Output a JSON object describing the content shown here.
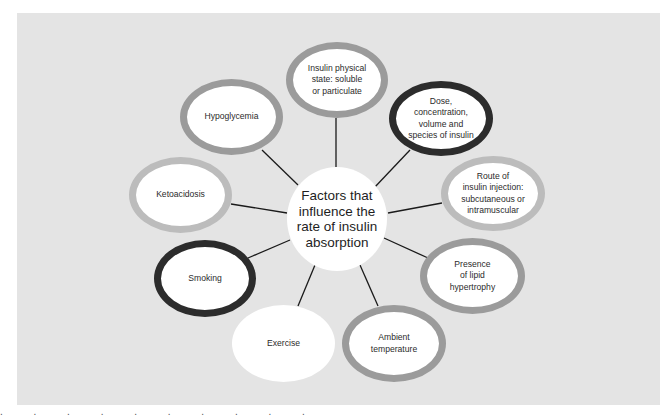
{
  "diagram": {
    "type": "hub-and-spoke",
    "center": {
      "label": "Factors that influence the rate of insulin absorption",
      "lines": [
        "Factors that",
        "influence the",
        "rate of insulin",
        "absorption"
      ]
    },
    "nodes": [
      {
        "id": "insulin-physical-state",
        "lines": [
          "Insulin physical",
          "state: soluble",
          "or particulate"
        ],
        "ring": "mid",
        "ring_color": "#9b9b9b"
      },
      {
        "id": "dose",
        "lines": [
          "Dose,",
          "concentration,",
          "volume and",
          "species of insulin"
        ],
        "ring": "dark",
        "ring_color": "#2c2c2c"
      },
      {
        "id": "route",
        "lines": [
          "Route of",
          "insulin injection:",
          "subcutaneous or",
          "intramuscular"
        ],
        "ring": "light",
        "ring_color": "#bcbcbc"
      },
      {
        "id": "lipid-hypertrophy",
        "lines": [
          "Presence",
          "of lipid",
          "hypertrophy"
        ],
        "ring": "mid",
        "ring_color": "#9b9b9b"
      },
      {
        "id": "ambient-temperature",
        "lines": [
          "Ambient",
          "temperature"
        ],
        "ring": "mid",
        "ring_color": "#9b9b9b"
      },
      {
        "id": "exercise",
        "lines": [
          "Exercise"
        ],
        "ring": "none",
        "ring_color": "#ffffff"
      },
      {
        "id": "smoking",
        "lines": [
          "Smoking"
        ],
        "ring": "dark",
        "ring_color": "#2c2c2c"
      },
      {
        "id": "ketoacidosis",
        "lines": [
          "Ketoacidosis"
        ],
        "ring": "light",
        "ring_color": "#bcbcbc"
      },
      {
        "id": "hypoglycemia",
        "lines": [
          "Hypoglycemia"
        ],
        "ring": "mid",
        "ring_color": "#9b9b9b"
      }
    ],
    "colors": {
      "panel_background": "#e4e4e4",
      "node_fill": "#ffffff",
      "connector": "#1a1a1a",
      "ring_mid": "#9b9b9b",
      "ring_light": "#bcbcbc",
      "ring_dark": "#2c2c2c"
    }
  },
  "footer": {
    "clipped_text": ". . . . . . . . . ."
  }
}
